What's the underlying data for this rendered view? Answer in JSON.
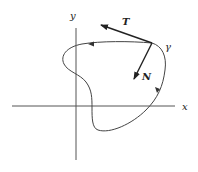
{
  "diagram": {
    "title": "",
    "labels": {
      "x_axis": "x",
      "y_axis": "y",
      "curve": "γ",
      "tangent": "T",
      "normal": "N"
    },
    "colors": {
      "stroke": "#333333",
      "background": "#ffffff"
    },
    "elements": [
      {
        "type": "axis",
        "name": "x-axis",
        "from": [
          12,
          106
        ],
        "to": [
          175,
          106
        ]
      },
      {
        "type": "axis",
        "name": "y-axis",
        "from": [
          76,
          28
        ],
        "to": [
          76,
          160
        ]
      },
      {
        "type": "closed-curve",
        "name": "gamma",
        "orientation": "counterclockwise",
        "direction_arrows": 2
      },
      {
        "type": "vector",
        "name": "tangent T",
        "from": [
          152,
          43
        ],
        "to": [
          100,
          24
        ]
      },
      {
        "type": "vector",
        "name": "normal N",
        "from": [
          152,
          43
        ],
        "to": [
          133,
          80
        ]
      }
    ]
  }
}
